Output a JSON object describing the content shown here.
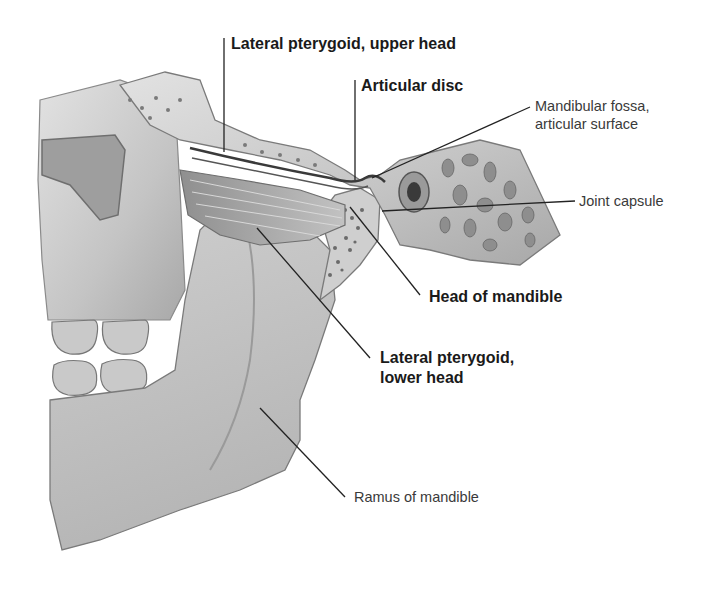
{
  "diagram": {
    "labels": {
      "lateral_pterygoid_upper": "Lateral pterygoid, upper head",
      "articular_disc": "Articular disc",
      "mandibular_fossa_line1": "Mandibular fossa,",
      "mandibular_fossa_line2": "articular surface",
      "joint_capsule": "Joint capsule",
      "head_of_mandible": "Head of mandible",
      "lateral_pterygoid_lower_line1": "Lateral pterygoid,",
      "lateral_pterygoid_lower_line2": "lower head",
      "ramus_of_mandible": "Ramus of mandible"
    },
    "colors": {
      "background": "#ffffff",
      "bone_light": "#d9d9d9",
      "bone_mid": "#b8b8b8",
      "bone_dark": "#8a8a8a",
      "leader_line": "#222222"
    }
  }
}
